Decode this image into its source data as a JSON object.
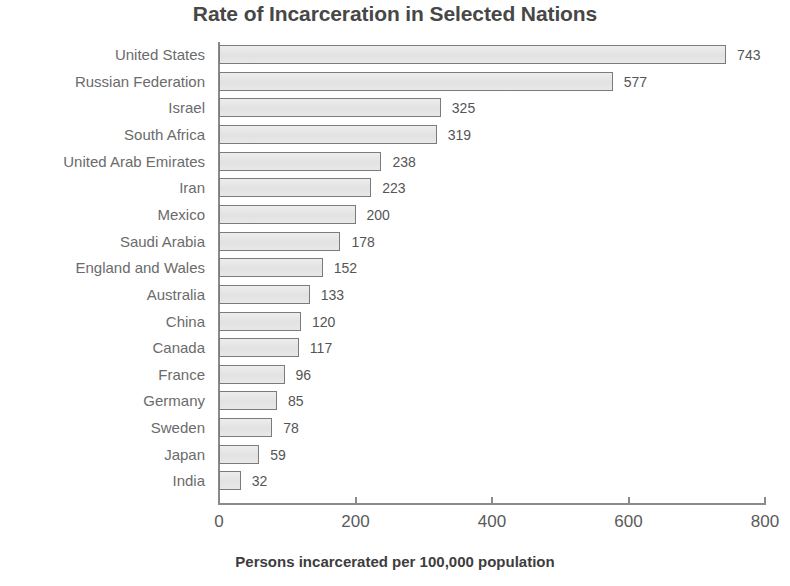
{
  "chart_data": {
    "type": "bar",
    "orientation": "horizontal",
    "title": "Rate of Incarceration in Selected Nations",
    "xlabel": "Persons incarcerated per 100,000 population",
    "ylabel": "",
    "xlim": [
      0,
      800
    ],
    "xticks": [
      0,
      200,
      400,
      600,
      800
    ],
    "xtick_labels": [
      "0",
      "200",
      "400",
      "600",
      "800"
    ],
    "grid": false,
    "legend": null,
    "categories": [
      "United States",
      "Russian Federation",
      "Israel",
      "South Africa",
      "United Arab Emirates",
      "Iran",
      "Mexico",
      "Saudi Arabia",
      "England and Wales",
      "Australia",
      "China",
      "Canada",
      "France",
      "Germany",
      "Sweden",
      "Japan",
      "India"
    ],
    "values": [
      743,
      577,
      325,
      319,
      238,
      223,
      200,
      178,
      152,
      133,
      120,
      117,
      96,
      85,
      78,
      59,
      32
    ],
    "value_labels": [
      "743",
      "577",
      "325",
      "319",
      "238",
      "223",
      "200",
      "178",
      "152",
      "133",
      "120",
      "117",
      "96",
      "85",
      "78",
      "59",
      "32"
    ],
    "bar_fill_color": "#e4e4e4",
    "bar_border_color": "#7b7b7b",
    "title_color": "#474747",
    "label_color": "#6b6b6b",
    "axis_color": "#8a8a8a"
  }
}
